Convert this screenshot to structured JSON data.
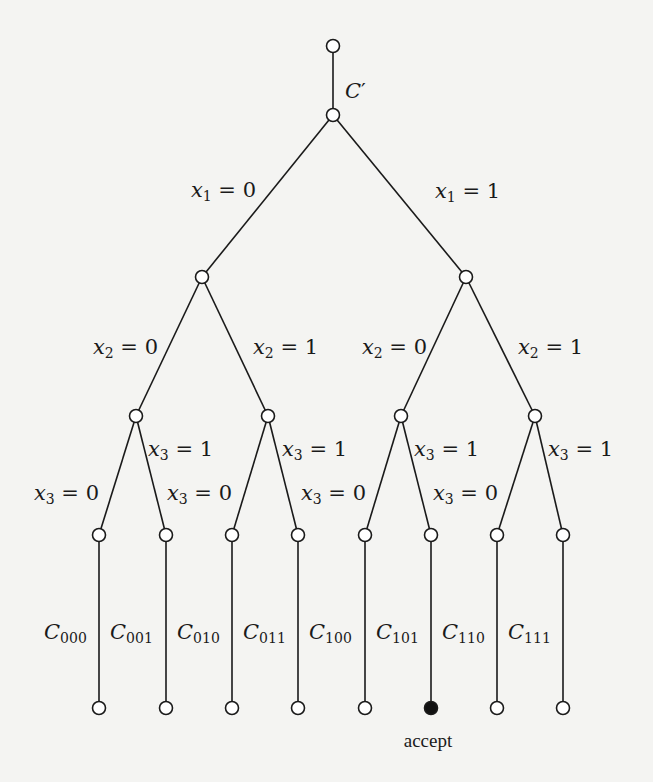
{
  "diagram": {
    "type": "binary-decision-tree",
    "root_edge_label": {
      "base": "C",
      "prime": "′"
    },
    "levels": [
      {
        "var": "x",
        "index": "1"
      },
      {
        "var": "x",
        "index": "2"
      },
      {
        "var": "x",
        "index": "3"
      }
    ],
    "branch_values": [
      "0",
      "1"
    ],
    "leaf_labels": [
      {
        "base": "C",
        "sub": "000",
        "accept": false
      },
      {
        "base": "C",
        "sub": "001",
        "accept": false
      },
      {
        "base": "C",
        "sub": "010",
        "accept": false
      },
      {
        "base": "C",
        "sub": "011",
        "accept": false
      },
      {
        "base": "C",
        "sub": "100",
        "accept": false
      },
      {
        "base": "C",
        "sub": "101",
        "accept": true
      },
      {
        "base": "C",
        "sub": "110",
        "accept": false
      },
      {
        "base": "C",
        "sub": "111",
        "accept": false
      }
    ],
    "accept_label": "accept",
    "colors": {
      "ink": "#1a1a1a",
      "paper": "#f4f4f2",
      "node_fill": "#ffffff",
      "accept_fill": "#111111"
    }
  }
}
